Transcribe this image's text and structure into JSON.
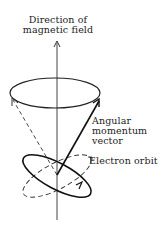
{
  "diagram": {
    "labels": {
      "field_line1": "Direction of",
      "field_line2": "magnetic field",
      "vector_line1": "Angular",
      "vector_line2": "momentum",
      "vector_line3": "vector",
      "orbit": "Electron orbit"
    },
    "colors": {
      "ink": "#222222",
      "background": "#ffffff"
    }
  }
}
